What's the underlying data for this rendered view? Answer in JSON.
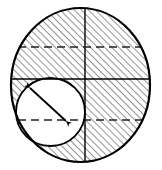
{
  "figure": {
    "type": "geometric-diagram",
    "canvas": {
      "width": 162,
      "height": 170,
      "background": "#ffffff"
    },
    "colors": {
      "stroke": "#000000",
      "hatch": "#111111",
      "fill_outer": "#ffffff",
      "fill_inner": "#ffffff",
      "dash": "#333333"
    },
    "outer_circle": {
      "label": "outer circle",
      "cx": 80.5,
      "cy": 85,
      "rx": 69.5,
      "ry": 77,
      "hatched": true,
      "stroke_width": 2.2
    },
    "inner_circle": {
      "label": "inner circle",
      "cx": 50.5,
      "cy": 112,
      "rx": 34.5,
      "ry": 34,
      "hatched": false,
      "stroke_width": 1.8
    },
    "hatch": {
      "angle_deg": 45,
      "spacing": 5,
      "line_width": 0.9
    },
    "lines": [
      {
        "name": "vertical-centerline",
        "style": "solid",
        "x1": 85,
        "y1": 10,
        "x2": 85,
        "y2": 160
      },
      {
        "name": "upper-horizontal-dashed",
        "style": "dashed",
        "x1": 24,
        "y1": 47,
        "x2": 146,
        "y2": 47
      },
      {
        "name": "middle-horizontal-solid",
        "style": "solid",
        "x1": 14,
        "y1": 79,
        "x2": 148,
        "y2": 79
      },
      {
        "name": "lower-horizontal-dashed",
        "style": "dashed",
        "x1": 26,
        "y1": 120,
        "x2": 146,
        "y2": 120
      }
    ],
    "arrow": {
      "name": "diameter-arrow",
      "style": "double-headed",
      "x1": 30,
      "y1": 88,
      "x2": 66,
      "y2": 121,
      "line_width": 1.8,
      "head_size": 6
    }
  }
}
